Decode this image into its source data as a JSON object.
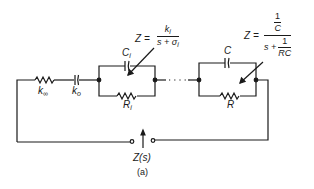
{
  "figure": {
    "caption": "(a)",
    "components": {
      "series_resistor": {
        "label": "k",
        "subscript": "∞"
      },
      "series_capacitor": {
        "label": "k",
        "subscript": "o"
      },
      "block_i": {
        "capacitor_label": "C",
        "capacitor_sub": "i",
        "resistor_label": "R",
        "resistor_sub": "i",
        "impedance": {
          "lhs": "Z =",
          "num": "k",
          "num_sub": "i",
          "den": "s + σ",
          "den_sub": "i"
        }
      },
      "block_last": {
        "capacitor_label": "C",
        "resistor_label": "R",
        "impedance": {
          "lhs": "Z =",
          "num_top": "1",
          "num_bottom": "C",
          "den_s": "s +",
          "den_top": "1",
          "den_bottom": "RC"
        }
      }
    },
    "terminal_label": "Z(s)",
    "colors": {
      "line": "#1a1a1a",
      "background": "#ffffff"
    }
  }
}
